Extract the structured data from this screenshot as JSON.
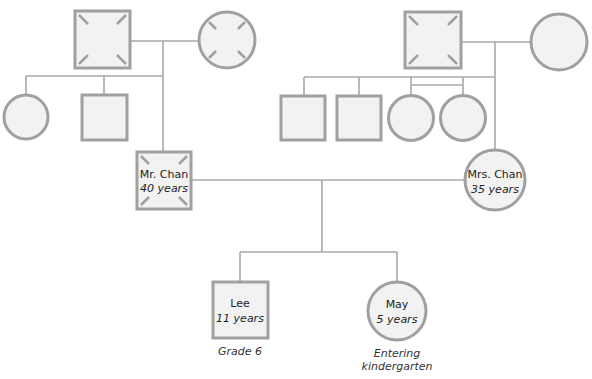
{
  "diagram": {
    "type": "genogram",
    "colors": {
      "line": "#a8a8a8",
      "shape_stroke": "#a0a0a0",
      "shape_fill": "#f2f2f2",
      "text": "#222222"
    },
    "people": {
      "paternal_grandfather": {
        "sex": "male",
        "deceased": true
      },
      "paternal_grandmother": {
        "sex": "female",
        "deceased": true
      },
      "paternal_aunt": {
        "sex": "female"
      },
      "paternal_uncle": {
        "sex": "male"
      },
      "maternal_grandfather": {
        "sex": "male",
        "deceased": true
      },
      "maternal_grandmother": {
        "sex": "female"
      },
      "maternal_uncle_1": {
        "sex": "male"
      },
      "maternal_uncle_2": {
        "sex": "male"
      },
      "maternal_aunt_twin_1": {
        "sex": "female",
        "twin": true
      },
      "maternal_aunt_twin_2": {
        "sex": "female",
        "twin": true
      },
      "father": {
        "sex": "male",
        "deceased": true,
        "name": "Mr. Chan",
        "age": "40 years"
      },
      "mother": {
        "sex": "female",
        "name": "Mrs. Chan",
        "age": "35 years"
      },
      "son": {
        "sex": "male",
        "name": "Lee",
        "age": "11 years",
        "caption": "Grade 6"
      },
      "daughter": {
        "sex": "female",
        "name": "May",
        "age": "5 years",
        "caption_line1": "Entering",
        "caption_line2": "kindergarten"
      }
    }
  }
}
